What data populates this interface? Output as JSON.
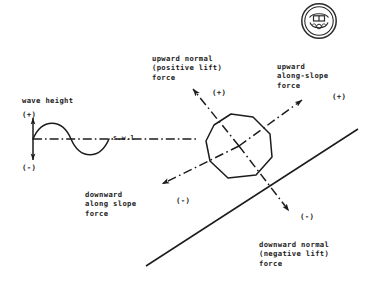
{
  "figure": {
    "type": "technical-line-diagram",
    "background_color": "#ffffff",
    "ink_color": "#1c1c1c",
    "wave_panel": {
      "axis_label": "wave height",
      "positive_sign": "(+)",
      "negative_sign": "(-)",
      "water_line_label": "s.w.l"
    },
    "forces": [
      {
        "id": "upward-normal",
        "label": "upward normal\n(positive lift)\nforce",
        "sign": "(+)",
        "direction": "up-left",
        "line_style": "dash-dot"
      },
      {
        "id": "upward-along-slope",
        "label": "upward\nalong-slope\nforce",
        "sign": "(+)",
        "direction": "up-right",
        "line_style": "dash-dot"
      },
      {
        "id": "downward-along-slope",
        "label": "downward\nalong slope\nforce",
        "sign": "(-)",
        "direction": "down-left",
        "line_style": "dash-dot"
      },
      {
        "id": "downward-normal",
        "label": "downward normal\n(negative lift)\nforce",
        "sign": "(-)",
        "direction": "down-right",
        "line_style": "dash-dot"
      }
    ],
    "armour_unit": {
      "shape": "irregular-octagon",
      "line_style": "solid"
    },
    "slope_line": {
      "style": "solid",
      "orientation": "rising to the right"
    },
    "stamp": {
      "name": "circular-library-stamp",
      "position": "top-right"
    }
  }
}
